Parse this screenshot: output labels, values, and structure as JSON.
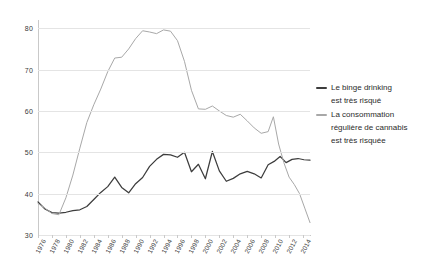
{
  "chart_data": {
    "type": "line",
    "title": "",
    "subtitle": "",
    "xlabel": "",
    "ylabel": "",
    "xlim": [
      1976,
      2015
    ],
    "ylim": [
      30,
      82
    ],
    "grid": true,
    "grid_axis": "y",
    "legend_position": "right",
    "yticks": [
      30,
      40,
      50,
      60,
      70,
      80
    ],
    "ytick_labels": [
      "30",
      "40",
      "50",
      "60",
      "70",
      "80"
    ],
    "xticks": [
      1976,
      1978,
      1980,
      1982,
      1984,
      1986,
      1988,
      1990,
      1992,
      1994,
      1996,
      1998,
      2000,
      2002,
      2004,
      2006,
      2008,
      2010,
      2012,
      2014
    ],
    "xtick_labels": [
      "1976",
      "1978",
      "1980",
      "1982",
      "1984",
      "1986",
      "1988",
      "1990",
      "1992",
      "1994",
      "1996",
      "1998",
      "2000",
      "2002",
      "2004",
      "2006",
      "2008",
      "2010",
      "2012",
      "2014"
    ],
    "x": [
      1976,
      1977,
      1978,
      1979,
      1980,
      1981,
      1982,
      1983,
      1984,
      1985,
      1986,
      1987,
      1988,
      1989,
      1990,
      1991,
      1992,
      1993,
      1994,
      1995,
      1996,
      1997,
      1998,
      1999,
      2000,
      2001,
      2002,
      2003,
      2004,
      2005,
      2006,
      2007,
      2008,
      2009,
      2010,
      2011,
      2012,
      2013,
      2014,
      2015
    ],
    "series": [
      {
        "name": "Le binge drinking est très risqué",
        "color": "#3d3d3d",
        "values": [
          38.0,
          36.3,
          35.4,
          35.3,
          35.5,
          35.9,
          36.1,
          36.9,
          38.6,
          40.3,
          41.7,
          44.0,
          41.5,
          40.2,
          42.4,
          43.9,
          46.6,
          48.3,
          49.5,
          49.4,
          48.8,
          50.0,
          45.3,
          47.1,
          43.6,
          50.2,
          45.5,
          43.0,
          43.7,
          44.8,
          45.4,
          44.8,
          43.8,
          43.2,
          44.6,
          45.9,
          46.7,
          47.0,
          46.5,
          47.4
        ]
      },
      {
        "name": "La consommation régulière de cannabis est très risquée",
        "color": "#a8a8a8",
        "values": [
          37.6,
          36.5,
          35.2,
          34.9,
          39.0,
          44.5,
          51.0,
          57.2,
          61.5,
          65.3,
          69.5,
          72.8,
          73.0,
          75.0,
          77.5,
          79.4,
          79.1,
          78.7,
          79.6,
          79.3,
          77.0,
          72.0,
          65.0,
          60.5,
          60.4,
          61.2,
          60.0,
          58.9,
          58.5,
          59.2,
          57.6,
          55.9,
          54.6,
          56.0,
          56.5,
          58.7,
          58.3,
          57.3,
          54.9,
          58.6
        ]
      }
    ],
    "series_tail": [
      {
        "name": "Le binge drinking est très risqué",
        "years": [
          2009,
          2010,
          2011,
          2012,
          2013,
          2014,
          2015
        ],
        "values": [
          47.0,
          47.8,
          49.0,
          47.5,
          48.3,
          48.5,
          48.2,
          48.1
        ]
      },
      {
        "name": "La consommation régulière de cannabis est très risquée",
        "years": [
          2009,
          2010,
          2011,
          2012,
          2013,
          2014,
          2015
        ],
        "values": [
          55.0,
          58.6,
          52.0,
          47.5,
          44.0,
          42.2,
          40.0,
          36.5,
          33.0
        ]
      }
    ]
  },
  "legend": {
    "entries": [
      {
        "swatch_color": "#3d3d3d",
        "lines": [
          "Le binge drinking",
          "est très risqué"
        ]
      },
      {
        "swatch_color": "#a8a8a8",
        "lines": [
          "La consommation",
          "régulière de cannabis",
          "est très risquée"
        ]
      }
    ]
  },
  "axes": {
    "y_labels": [
      "80",
      "70",
      "60",
      "50",
      "40",
      "30"
    ],
    "x_labels": [
      "1976",
      "1978",
      "1980",
      "1982",
      "1984",
      "1986",
      "1988",
      "1990",
      "1992",
      "1994",
      "1996",
      "1998",
      "2000",
      "2002",
      "2004",
      "2006",
      "2008",
      "2010",
      "2012",
      "2014"
    ]
  },
  "colors": {
    "background": "#ffffff",
    "gridline": "#e4e4e4",
    "axis": "#c9c9c9",
    "dark_series": "#3d3d3d",
    "light_series": "#a8a8a8",
    "text": "#3a3a3a"
  }
}
